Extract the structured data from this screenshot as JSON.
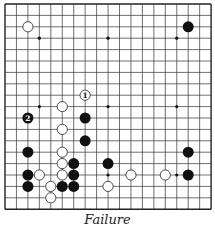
{
  "diagram": {
    "caption": "Failure",
    "grid": {
      "size": 19,
      "origin_x": 5,
      "origin_y": 4,
      "spacing_x": 11.45,
      "spacing_y": 11.4,
      "line_color": "#333333",
      "border_color": "#222222"
    },
    "star_points": [
      [
        3,
        3
      ],
      [
        9,
        3
      ],
      [
        15,
        3
      ],
      [
        3,
        9
      ],
      [
        9,
        9
      ],
      [
        15,
        9
      ],
      [
        3,
        15
      ],
      [
        9,
        15
      ],
      [
        15,
        15
      ]
    ],
    "stones": [
      {
        "color": "white",
        "col": 2,
        "row": 2
      },
      {
        "color": "black",
        "col": 16,
        "row": 2
      },
      {
        "color": "white",
        "col": 7,
        "row": 8,
        "label": "1"
      },
      {
        "color": "white",
        "col": 5,
        "row": 9
      },
      {
        "color": "black",
        "col": 2,
        "row": 10,
        "label": "2"
      },
      {
        "color": "black",
        "col": 7,
        "row": 10
      },
      {
        "color": "white",
        "col": 5,
        "row": 11
      },
      {
        "color": "black",
        "col": 7,
        "row": 12
      },
      {
        "color": "black",
        "col": 2,
        "row": 13
      },
      {
        "color": "white",
        "col": 5,
        "row": 13
      },
      {
        "color": "black",
        "col": 16,
        "row": 13
      },
      {
        "color": "white",
        "col": 5,
        "row": 14
      },
      {
        "color": "black",
        "col": 6,
        "row": 14
      },
      {
        "color": "black",
        "col": 9,
        "row": 14
      },
      {
        "color": "black",
        "col": 2,
        "row": 15
      },
      {
        "color": "white",
        "col": 3,
        "row": 15
      },
      {
        "color": "white",
        "col": 5,
        "row": 15
      },
      {
        "color": "black",
        "col": 6,
        "row": 15
      },
      {
        "color": "white",
        "col": 11,
        "row": 15
      },
      {
        "color": "white",
        "col": 14,
        "row": 15
      },
      {
        "color": "black",
        "col": 16,
        "row": 15
      },
      {
        "color": "black",
        "col": 2,
        "row": 16
      },
      {
        "color": "white",
        "col": 4,
        "row": 16
      },
      {
        "color": "black",
        "col": 5,
        "row": 16
      },
      {
        "color": "black",
        "col": 6,
        "row": 16
      },
      {
        "color": "white",
        "col": 9,
        "row": 16
      },
      {
        "color": "white",
        "col": 4,
        "row": 17
      }
    ],
    "colors": {
      "black_stone": "#111111",
      "white_stone": "#ffffff",
      "white_stone_edge": "#222222"
    }
  }
}
